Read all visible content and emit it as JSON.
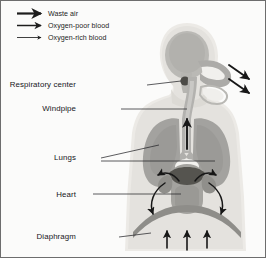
{
  "figure": {
    "background_color": "#fbfbfa",
    "border_color": "#6d6d6d"
  },
  "legend": {
    "items": [
      {
        "label": "Waste air",
        "icon": "arrow-right-icon",
        "stroke_width": 2.2,
        "color": "#1d1d1d"
      },
      {
        "label": "Oxygen-poor blood",
        "icon": "arrow-right-icon",
        "stroke_width": 1.5,
        "color": "#1d1d1d"
      },
      {
        "label": "Oxygen-rich blood",
        "icon": "arrow-right-icon",
        "stroke_width": 0.85,
        "color": "#1d1d1d"
      }
    ]
  },
  "labels": [
    {
      "name": "respiratory-center",
      "text": "Respiratory center"
    },
    {
      "name": "windpipe",
      "text": "Windpipe"
    },
    {
      "name": "lungs",
      "text": "Lungs"
    },
    {
      "name": "heart",
      "text": "Heart"
    },
    {
      "name": "diaphragm",
      "text": "Diaphragm"
    }
  ],
  "anatomy": {
    "body_fill": "#e6e5e2",
    "body_outline": "#d2d1cc",
    "organ_fill": "#a9a8a5",
    "organ_dark": "#8e8d8a",
    "heart_chamber": "#55544f",
    "airway_fill": "#b4b3b0",
    "airway_light": "#f2f1ee",
    "respiratory_center_fill": "#4c4b47",
    "arrow_color": "#171717"
  },
  "flow_arrows": {
    "nasal_count": 2,
    "windpipe_count": 1,
    "heart_count": 4,
    "diaphragm_count": 3
  }
}
